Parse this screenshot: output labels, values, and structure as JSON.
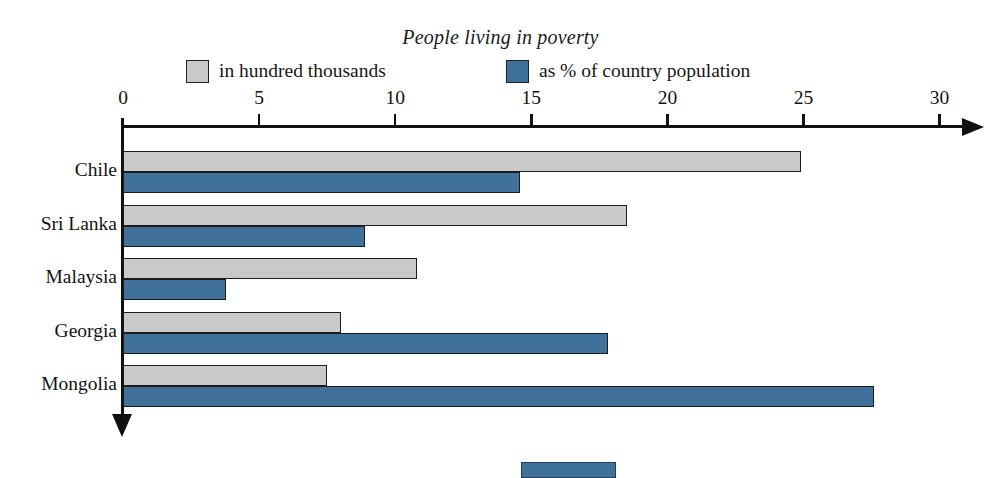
{
  "chart_data": {
    "type": "bar",
    "orientation": "horizontal",
    "title": "People living in poverty",
    "xlabel": "",
    "ylabel": "",
    "categories": [
      "Chile",
      "Sri Lanka",
      "Malaysia",
      "Georgia",
      "Mongolia"
    ],
    "series": [
      {
        "name": "in hundred thousands",
        "color": "#c9c9c9",
        "values": [
          24.9,
          18.5,
          10.8,
          8.0,
          7.5
        ]
      },
      {
        "name": "as % of country population",
        "color": "#3f719a",
        "values": [
          14.6,
          8.9,
          3.8,
          17.8,
          27.6
        ]
      }
    ],
    "xlim": [
      0,
      30
    ],
    "xticks": [
      0,
      5,
      10,
      15,
      20,
      25,
      30
    ],
    "xtick_labels": [
      "0",
      "5",
      "10",
      "15",
      "20",
      "25",
      "30"
    ],
    "grid": false,
    "legend_position": "top"
  },
  "axis": {
    "x_arrow": "arrow-right",
    "y_arrow": "arrow-down"
  },
  "legend": {
    "entries": [
      {
        "label": "in hundred thousands",
        "color": "#c9c9c9"
      },
      {
        "label": "as % of country population",
        "color": "#3f719a"
      }
    ]
  }
}
